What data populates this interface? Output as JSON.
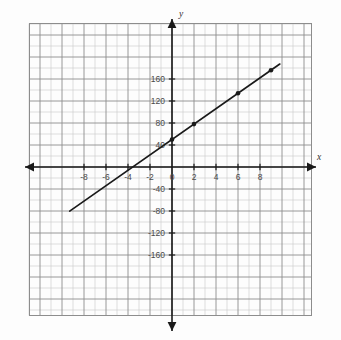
{
  "figure": {
    "kind": "coordinate-plane-line-graph",
    "axis_labels": {
      "x": "x",
      "y": "y"
    }
  },
  "chart_data": {
    "type": "line",
    "title": "",
    "xlabel": "x",
    "ylabel": "y",
    "grid": true,
    "legend": "none",
    "xlim": [
      -10,
      10
    ],
    "ylim": [
      -200,
      200
    ],
    "x_major_step": 2,
    "y_major_step": 40,
    "x_minor_step": 1,
    "y_minor_step": 20,
    "x_tick_labels": [
      "-8",
      "-6",
      "-4",
      "-2",
      "0",
      "2",
      "4",
      "6",
      "8"
    ],
    "x_tick_values": [
      -8,
      -6,
      -4,
      -2,
      0,
      2,
      4,
      6,
      8
    ],
    "y_tick_labels": [
      "160",
      "120",
      "80",
      "40",
      "-40",
      "-80",
      "-120",
      "-160"
    ],
    "y_tick_values": [
      160,
      120,
      80,
      40,
      -40,
      -80,
      -120,
      -160
    ],
    "series": [
      {
        "name": "line",
        "equation": "y = 14x + 50",
        "slope": 14,
        "intercept": 50,
        "x_start": -9.3,
        "x_end": 9.8,
        "marked_points": [
          {
            "x": 0,
            "y": 50
          },
          {
            "x": 2,
            "y": 78
          },
          {
            "x": 6,
            "y": 134
          },
          {
            "x": 9,
            "y": 176
          }
        ]
      }
    ]
  },
  "style": {
    "grid_minor_color": "#c9c9c9",
    "grid_major_color": "#8d8d8d",
    "axis_color": "#1a1a1a",
    "line_color": "#1a1a1a",
    "point_color": "#1a1a1a",
    "background": "#fdfdfd"
  }
}
